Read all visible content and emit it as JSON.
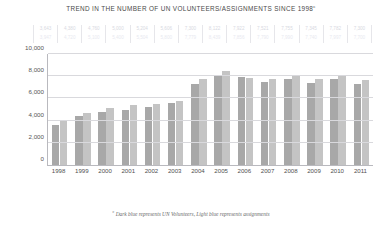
{
  "chart_data": {
    "type": "bar",
    "title": "TREND IN THE NUMBER OF UN VOLUNTEERS/ASSIGNMENTS SINCE 1998",
    "title_footnote_marker": "c",
    "xlabel": "",
    "ylabel": "",
    "ylim": [
      0,
      10000
    ],
    "yticks": [
      "0",
      "2,000",
      "4,000",
      "6,000",
      "8,000",
      "10,000"
    ],
    "ytick_values": [
      0,
      2000,
      4000,
      6000,
      8000,
      10000
    ],
    "grid": true,
    "legend_position": "footnote",
    "categories": [
      "1998",
      "1999",
      "2000",
      "2001",
      "2002",
      "2003",
      "2004",
      "2005",
      "2006",
      "2007",
      "2008",
      "2009",
      "2010",
      "2011"
    ],
    "series": [
      {
        "name": "UN Volunteers",
        "color": "#a8a8a8",
        "values": [
          3643,
          4380,
          4760,
          5000,
          5204,
          5606,
          7300,
          8122,
          7922,
          7521,
          7755,
          7345,
          7782,
          7300
        ],
        "labels": [
          "3,643",
          "4,380",
          "4,760",
          "5,000",
          "5,204",
          "5,606",
          "7,300",
          "8,122",
          "7,922",
          "7,521",
          "7,755",
          "7,345",
          "7,782",
          "7,300"
        ]
      },
      {
        "name": "assignments",
        "color": "#c4c4c4",
        "values": [
          3947,
          4720,
          5100,
          5400,
          5504,
          5800,
          7779,
          8439,
          7856,
          7790,
          7990,
          7740,
          7997,
          7700
        ],
        "labels": [
          "3,947",
          "4,720",
          "5,100",
          "5,400",
          "5,504",
          "5,800",
          "7,779",
          "8,439",
          "7,856",
          "7,790",
          "7,990",
          "7,740",
          "7,997",
          "7,700"
        ]
      }
    ],
    "annotations": {
      "footnote": "Dark blue represents UN Volunteers, Light blue represents assignments",
      "footnote_marker": "c"
    }
  }
}
